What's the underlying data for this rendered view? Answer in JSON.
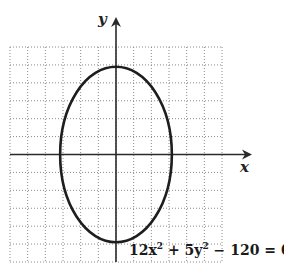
{
  "chart_data": {
    "type": "line",
    "title": "",
    "xlabel": "x",
    "ylabel": "y",
    "xlim": [
      -6,
      6
    ],
    "ylim": [
      -6,
      6
    ],
    "grid": true,
    "grid_step": 1,
    "series": [
      {
        "name": "ellipse",
        "equation": "12x² + 5y² − 120 = 0",
        "center": [
          0,
          0
        ],
        "semi_axis_x": 3.162,
        "semi_axis_y": 4.899
      }
    ],
    "annotations": [
      {
        "text": "12x² + 5y² − 120 = 0",
        "position": "bottom-right"
      }
    ]
  },
  "labels": {
    "x_axis": "x",
    "y_axis": "y",
    "equation_main": "12x",
    "equation_sup1": "2",
    "equation_mid": " + 5y",
    "equation_sup2": "2",
    "equation_end": " − 120 = 0"
  },
  "colors": {
    "curve": "#1e1e1e",
    "axis": "#2a2a2a",
    "grid": "#8a8a8a"
  }
}
